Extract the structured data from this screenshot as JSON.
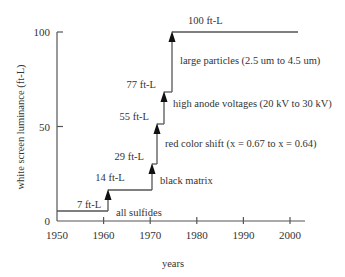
{
  "chart_data": {
    "type": "line",
    "style": "step",
    "title": "",
    "xlabel": "years",
    "ylabel": "white screen luminance (ft-L)",
    "xlim": [
      1950,
      2002
    ],
    "ylim": [
      0,
      100
    ],
    "x_ticks": [
      1950,
      1960,
      1970,
      1980,
      1990,
      2000
    ],
    "x_tick_labels": [
      "1950",
      "1960",
      "1970",
      "1980",
      "1990",
      "2000"
    ],
    "y_ticks": [
      0,
      50,
      100
    ],
    "y_tick_labels": [
      "0",
      "50",
      "100"
    ],
    "grid": false,
    "legend": "none",
    "line_color": "#555555",
    "series": [
      {
        "name": "luminance",
        "steps": [
          {
            "x_start": 1950,
            "x_end": 1961,
            "y": 7,
            "label": "7 ft-L"
          },
          {
            "x_start": 1961,
            "x_end": 1970,
            "y": 14,
            "label": "14 ft-L"
          },
          {
            "x_start": 1970,
            "x_end": 1971.5,
            "y": 29,
            "label": "29 ft-L"
          },
          {
            "x_start": 1971.5,
            "x_end": 1973,
            "y": 55,
            "label": "55 ft-L"
          },
          {
            "x_start": 1973,
            "x_end": 1974.5,
            "y": 77,
            "label": "77 ft-L"
          },
          {
            "x_start": 1974.5,
            "x_end": 2002,
            "y": 100,
            "label": "100 ft-L"
          }
        ]
      }
    ],
    "annotations": [
      {
        "text": "all sulfides",
        "x": 1961,
        "y": 7
      },
      {
        "text": "black matrix",
        "x": 1970,
        "y": 14
      },
      {
        "text": "red color shift (x = 0.67 to x = 0.64)",
        "x": 1971.5,
        "y": 29
      },
      {
        "text": "high anode voltages (20 kV to 30 kV)",
        "x": 1973,
        "y": 55
      },
      {
        "text": "large particles (2.5 um to 4.5 um)",
        "x": 1974.5,
        "y": 77
      }
    ]
  }
}
